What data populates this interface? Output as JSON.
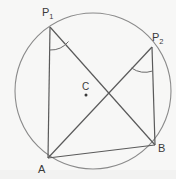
{
  "figure": {
    "background_color": "#f7f7f6",
    "stroke_color": "#555555",
    "circle_stroke_color": "#777777",
    "label_color": "#3a3a3a",
    "labels": {
      "p1_base": "P",
      "p1_sub": "1",
      "p2_base": "P",
      "p2_sub": "2",
      "a": "A",
      "b": "B",
      "center": "C"
    },
    "circle": {
      "center_x": 93,
      "center_y": 91,
      "radius": 78
    },
    "points": [
      {
        "name": "P1",
        "label": "P₁",
        "x": 50,
        "y": 27
      },
      {
        "name": "P2",
        "label": "P₂",
        "x": 152,
        "y": 47
      },
      {
        "name": "A",
        "label": "A",
        "x": 48,
        "y": 158
      },
      {
        "name": "B",
        "label": "B",
        "x": 155,
        "y": 145
      },
      {
        "name": "C",
        "label": "C",
        "x": 86,
        "y": 95
      }
    ],
    "segments": [
      {
        "name": "P1-A",
        "from": "P1",
        "to": "A"
      },
      {
        "name": "P1-B",
        "from": "P1",
        "to": "B"
      },
      {
        "name": "P2-A",
        "from": "P2",
        "to": "A"
      },
      {
        "name": "P2-B",
        "from": "P2",
        "to": "B"
      },
      {
        "name": "A-B",
        "from": "A",
        "to": "B"
      }
    ],
    "angle_marks": [
      {
        "name": "angle-at-p1",
        "vertex": "P1"
      },
      {
        "name": "angle-at-p2",
        "vertex": "P2"
      }
    ]
  }
}
